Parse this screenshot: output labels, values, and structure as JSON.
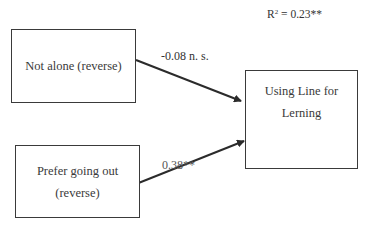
{
  "diagram": {
    "type": "path-model",
    "r_squared": {
      "prefix": "R",
      "superscript": "2",
      "value": " = 0.23**"
    },
    "nodes": [
      {
        "id": "not_alone",
        "lines": [
          "Not alone (reverse)"
        ]
      },
      {
        "id": "prefer_going_out",
        "lines": [
          "Prefer going out",
          "(reverse)"
        ]
      },
      {
        "id": "outcome",
        "lines": [
          "Using Line for",
          "Lerning"
        ]
      }
    ],
    "edges": [
      {
        "from": "not_alone",
        "to": "outcome",
        "label": "-0.08 n. s."
      },
      {
        "from": "prefer_going_out",
        "to": "outcome",
        "label": "0.38**"
      }
    ],
    "colors": {
      "stroke": "#2b2b2b",
      "text": "#333333",
      "background": "#ffffff"
    }
  }
}
